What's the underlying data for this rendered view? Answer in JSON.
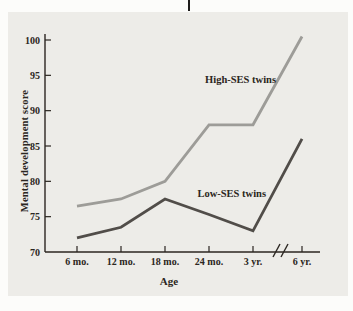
{
  "chart_data": {
    "type": "line",
    "title": "",
    "xlabel": "Age",
    "ylabel": "Mental development score",
    "categories": [
      "6 mo.",
      "12 mo.",
      "18 mo.",
      "24 mo.",
      "3 yr.",
      "6 yr."
    ],
    "x_axis_break": {
      "after_category": "3 yr.",
      "symbol": "//"
    },
    "series": [
      {
        "name": "High-SES twins",
        "values": [
          76.5,
          77.5,
          80,
          88,
          88,
          100.5
        ],
        "color": "#9d9c98"
      },
      {
        "name": "Low-SES twins",
        "values": [
          72,
          73.5,
          77.5,
          75.3,
          73,
          86
        ],
        "color": "#514d49"
      }
    ],
    "y_ticks": [
      70,
      75,
      80,
      85,
      90,
      95,
      100
    ],
    "ylim": [
      70,
      101
    ],
    "grid": false,
    "legend": "inline-labels",
    "colors": {
      "panel_bg": "#edece8",
      "axis": "#2b2621",
      "text": "#2b2621"
    }
  }
}
